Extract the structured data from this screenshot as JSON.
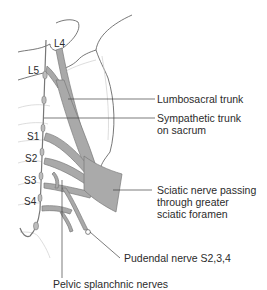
{
  "figure": {
    "colors": {
      "nerve_fill": "#a9a9a9",
      "nerve_stroke": "#7a7a7a",
      "bone_outline": "#555555",
      "faint_outline": "#c8c8c8",
      "leader_line": "#444444",
      "text": "#2b2b2b",
      "background": "#ffffff"
    },
    "segment_labels": [
      "L4",
      "L5",
      "S1",
      "S2",
      "S3",
      "S4"
    ],
    "callouts": [
      {
        "id": "lumbosacral",
        "lines": [
          "Lumbosacral trunk"
        ]
      },
      {
        "id": "sympathetic",
        "lines": [
          "Sympathetic trunk",
          "on sacrum"
        ]
      },
      {
        "id": "sciatic",
        "lines": [
          "Sciatic nerve passing",
          "through greater",
          "sciatic foramen"
        ]
      },
      {
        "id": "pudendal",
        "lines": [
          "Pudendal nerve S2,3,4"
        ]
      },
      {
        "id": "pelvic",
        "lines": [
          "Pelvic splanchnic nerves"
        ]
      }
    ]
  }
}
